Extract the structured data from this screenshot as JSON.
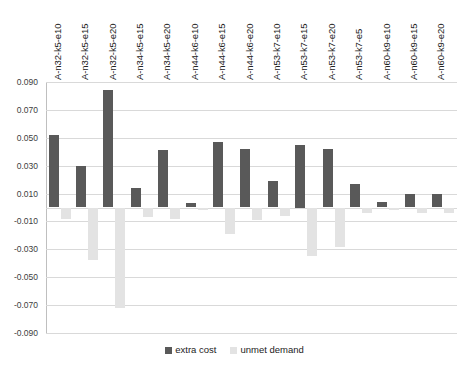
{
  "chart_data": {
    "type": "bar",
    "title": "",
    "subtitle": "",
    "xlabel": "",
    "ylabel": "",
    "ylim": [
      -0.09,
      0.09
    ],
    "ytick_labels": [
      "0.090",
      "0.070",
      "0.050",
      "0.030",
      "0.010",
      "-0.010",
      "-0.030",
      "-0.050",
      "-0.070",
      "-0.090"
    ],
    "ytick_values": [
      0.09,
      0.07,
      0.05,
      0.03,
      0.01,
      -0.01,
      -0.03,
      -0.05,
      -0.07,
      -0.09
    ],
    "grid": true,
    "legend_position": "bottom",
    "categories": [
      "A-n32-k5-e10",
      "A-n32-k5-e15",
      "A-n32-k5-e20",
      "A-n34-k5-e15",
      "A-n34-k5-e20",
      "A-n44-k6-e10",
      "A-n44-k6-e15",
      "A-n44-k6-e20",
      "A-n53-k7-e10",
      "A-n53-k7-e15",
      "A-n53-k7-e20",
      "A-n53-k7-e5",
      "A-n60-k9-e10",
      "A-n60-k9-e15",
      "A-n60-k9-e20"
    ],
    "series": [
      {
        "name": "extra cost",
        "color": "#595959",
        "values": [
          0.052,
          0.03,
          0.084,
          0.014,
          0.041,
          0.003,
          0.047,
          0.042,
          0.019,
          0.045,
          0.042,
          0.017,
          0.004,
          0.01,
          0.01
        ]
      },
      {
        "name": "unmet demand",
        "color": "#e3e3e3",
        "values": [
          -0.008,
          -0.038,
          -0.072,
          -0.007,
          -0.008,
          -0.002,
          -0.019,
          -0.009,
          -0.006,
          -0.035,
          -0.028,
          -0.004,
          -0.002,
          -0.004,
          -0.004
        ]
      }
    ]
  },
  "legend": {
    "items": [
      {
        "label": "extra cost",
        "color": "#595959"
      },
      {
        "label": "unmet demand",
        "color": "#e3e3e3"
      }
    ]
  }
}
